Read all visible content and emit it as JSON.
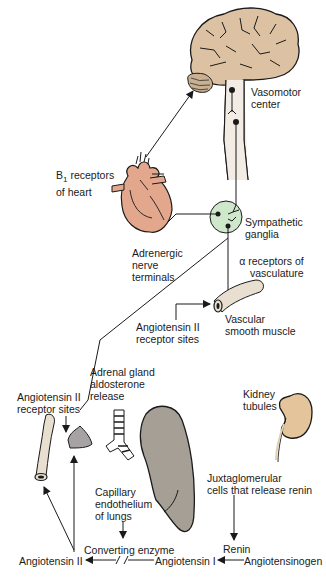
{
  "diagram": {
    "type": "physiology-pathway",
    "colors": {
      "brain": "#dcc2a3",
      "heart": "#e3a78e",
      "ganglia": "#cfe8cc",
      "vessel": "#e9dfd0",
      "adrenal": "#a7a3a5",
      "lung": "#a59f96",
      "kidney": "#e4c49a",
      "line": "#1a1a1a"
    },
    "labels": {
      "vasomotor": [
        "Vasomotor",
        "center"
      ],
      "b1_receptors": [
        "receptors",
        "of heart"
      ],
      "b1_prefix": "B",
      "b1_sub": "1",
      "sympathetic": [
        "Sympathetic",
        "ganglia"
      ],
      "adrenergic": [
        "Adrenergic",
        "nerve",
        "terminals"
      ],
      "alpha_receptors": [
        "α receptors of",
        "vasculature"
      ],
      "angiotensin_receptor_top": [
        "Angiotensin II",
        "receptor sites"
      ],
      "vascular_smooth": [
        "Vascular",
        "smooth muscle"
      ],
      "adrenal": [
        "Adrenal gland",
        "aldosterone",
        "release"
      ],
      "angiotensin_receptor_left": [
        "Angiotensin II",
        "receptor sites"
      ],
      "kidney": [
        "Kidney",
        "tubules"
      ],
      "capillary": [
        "Capillary",
        "endothelium",
        "of lungs"
      ],
      "juxtaglomerular": [
        "Juxtaglomerular",
        "cells that release renin"
      ],
      "converting_enzyme": "Converting enzyme",
      "renin": "Renin",
      "angiotensin_ii": "Angiotensin II",
      "angiotensin_i": "Angiotensin I",
      "angiotensinogen": "Angiotensinogen"
    }
  }
}
